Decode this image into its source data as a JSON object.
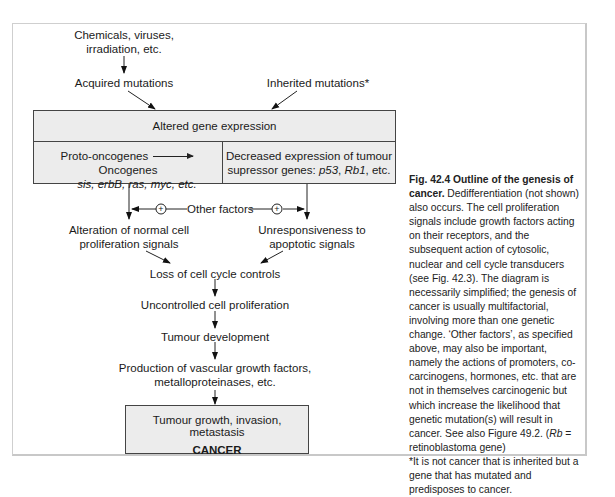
{
  "figure": {
    "nodes": {
      "chemicals": [
        "Chemicals, viruses,",
        "irradiation, etc."
      ],
      "acquired": "Acquired mutations",
      "inherited": "Inherited mutations*",
      "altered": "Altered gene expression",
      "proto": "Proto-oncogenes",
      "onco": "Oncogenes",
      "onco_examples": "sis, erbB, ras, myc, etc.",
      "decreased_line1": "Decreased expression of tumour",
      "decreased_line2_prefix": "supressor genes: ",
      "decreased_gene1": "p53",
      "decreased_sep": ", ",
      "decreased_gene2": "Rb1",
      "decreased_suffix": ", etc.",
      "other_factors": "Other factors",
      "plus": "+",
      "alteration": [
        "Alteration of normal cell",
        "proliferation signals"
      ],
      "unresponsive": [
        "Unresponsiveness to",
        "apoptotic signals"
      ],
      "loss": "Loss of cell cycle controls",
      "uncontrolled": "Uncontrolled cell proliferation",
      "tumour_dev": "Tumour development",
      "production": [
        "Production of vascular growth factors,",
        "metalloproteinases, etc."
      ],
      "final": "Tumour growth, invasion, metastasis",
      "cancer": "CANCER"
    },
    "caption": {
      "title": "Fig. 42.4    Outline of the genesis of cancer.",
      "body": " Dedifferentiation (not shown) also occurs. The cell proliferation signals include growth factors acting on their receptors, and the subsequent action of cytosolic, nuclear and cell cycle transducers (see Fig. 42.3). The diagram is necessarily simplified; the genesis of cancer is usually multifactorial, involving more than one genetic change. ‘Other factors’, as specified above, may also be important, namely the actions of promoters, co-carcinogens, hormones, etc. that are not in themselves carcinogenic but which increase the likelihood that genetic mutation(s) will result in cancer. See also Figure 49.2. (",
      "rb_italic": "Rb",
      "rb_rest": " = retinoblastoma gene)",
      "footnote": "*It is not cancer that is inherited but a gene that has mutated and predisposes to cancer."
    },
    "colors": {
      "box_fill": "#ececec",
      "line": "#222222",
      "frame": "#cfcfcf"
    }
  }
}
